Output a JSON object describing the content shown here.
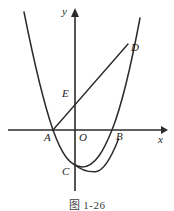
{
  "figure": {
    "caption": "图 1-26",
    "background_color": "#ffffff",
    "ink_color": "#2b2b2b",
    "width": 174,
    "height": 211
  },
  "axes": {
    "x_label": "x",
    "y_label": "y",
    "origin_label": "O",
    "x_axis": {
      "y_px": 130,
      "x_start_px": 8,
      "x_end_px": 166
    },
    "y_axis": {
      "x_px": 75,
      "y_start_px": 10,
      "y_end_px": 191
    }
  },
  "points": [
    {
      "name": "A",
      "label": "A",
      "x_px": 53,
      "y_px": 130,
      "label_x_px": 44,
      "label_y_px": 133,
      "description": "left x-intercept of parabola, left endpoint of segment AD"
    },
    {
      "name": "B",
      "label": "B",
      "x_px": 112,
      "y_px": 130,
      "label_x_px": 116,
      "label_y_px": 132,
      "description": "right x-intercept of parabola"
    },
    {
      "name": "C",
      "label": "C",
      "x_px": 74,
      "y_px": 164,
      "label_x_px": 63,
      "label_y_px": 167,
      "description": "y-intercept of parabola, vertex of lower curve"
    },
    {
      "name": "D",
      "label": "D",
      "x_px": 126,
      "y_px": 46,
      "label_x_px": 131,
      "label_y_px": 44,
      "description": "upper intersection of line and right branch"
    },
    {
      "name": "E",
      "label": "E",
      "x_px": 75,
      "y_px": 99,
      "label_x_px": 63,
      "label_y_px": 90,
      "description": "intersection of segment AD with the y-axis"
    },
    {
      "name": "O",
      "label": "O",
      "x_px": 75,
      "y_px": 130,
      "label_x_px": 80,
      "label_y_px": 133,
      "description": "origin"
    }
  ],
  "curves": [
    {
      "name": "main-parabola",
      "kind": "parabola",
      "opens": "up",
      "roots_px": [
        53,
        112
      ],
      "vertex_px": [
        82,
        167
      ],
      "y_intercept_px": 164,
      "path": "M 24 12 C 34 62 44 104 53 130 C 62 155 70 166 82 167 C 95 167 104 150 112 130 C 122 105 131 66 140 18"
    },
    {
      "name": "secondary-parabola",
      "kind": "parabola",
      "opens": "up",
      "vertex_px": [
        95,
        172
      ],
      "path": "M 74 164 C 81 170 88 172 95 172 C 103 172 110 162 118 140"
    }
  ],
  "segments": [
    {
      "name": "line-AD",
      "from": "A",
      "to": "D",
      "x1_px": 53,
      "y1_px": 130,
      "x2_px": 128,
      "y2_px": 44
    }
  ]
}
